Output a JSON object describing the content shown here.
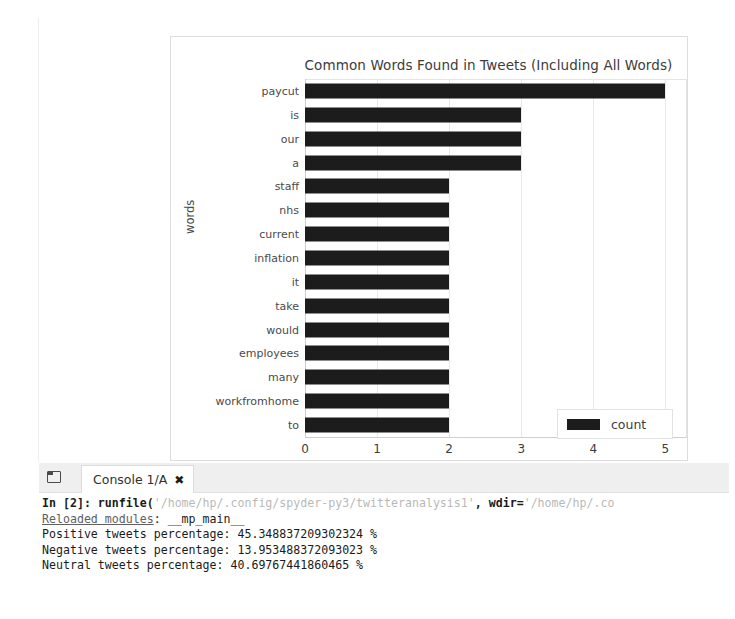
{
  "chart_data": {
    "type": "bar",
    "orientation": "horizontal",
    "title": "Common Words Found in Tweets (Including All Words)",
    "xlabel": "",
    "ylabel": "words",
    "categories": [
      "paycut",
      "is",
      "our",
      "a",
      "staff",
      "nhs",
      "current",
      "inflation",
      "it",
      "take",
      "would",
      "employees",
      "many",
      "workfromhome",
      "to"
    ],
    "values": [
      5,
      3,
      3,
      3,
      2,
      2,
      2,
      2,
      2,
      2,
      2,
      2,
      2,
      2,
      2
    ],
    "xticks": [
      "0",
      "1",
      "2",
      "3",
      "4",
      "5"
    ],
    "xlim": [
      0,
      5.3
    ],
    "grid": true,
    "legend": {
      "position": "lower right",
      "entries": [
        {
          "name": "count",
          "color": "#1c1c1c"
        }
      ]
    },
    "series": [
      {
        "name": "count",
        "color": "#1c1c1c",
        "values": [
          5,
          3,
          3,
          3,
          2,
          2,
          2,
          2,
          2,
          2,
          2,
          2,
          2,
          2,
          2
        ]
      }
    ]
  },
  "console": {
    "tab_label": "Console 1/A",
    "close_label": "✖",
    "browse_icon": "browse-tabs-icon",
    "lines": [
      {
        "segments": [
          {
            "text": "In [2]: runfile(",
            "style": "kw"
          },
          {
            "text": "'/home/hp/.config/spyder-py3/twitteranalysis1'",
            "style": "str"
          },
          {
            "text": ", ",
            "style": "kw"
          },
          {
            "text": "wdir=",
            "style": "kw"
          },
          {
            "text": "'/home/hp/.co",
            "style": "str"
          }
        ]
      },
      {
        "segments": [
          {
            "text": "Reloaded modules",
            "style": "ul"
          },
          {
            "text": ": __mp_main__",
            "style": "plain"
          }
        ]
      },
      {
        "segments": [
          {
            "text": "Positive tweets percentage: 45.348837209302324 %",
            "style": "plain"
          }
        ]
      },
      {
        "segments": [
          {
            "text": "Negative tweets percentage: 13.953488372093023 %",
            "style": "plain"
          }
        ]
      },
      {
        "segments": [
          {
            "text": "Neutral tweets percentage: 40.69767441860465 %",
            "style": "plain"
          }
        ]
      }
    ]
  }
}
